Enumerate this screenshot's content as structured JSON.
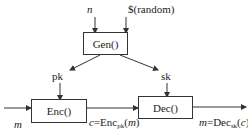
{
  "diagram": {
    "type": "public-key encryption scheme",
    "inputs": {
      "n": "n",
      "random": "$(random)"
    },
    "boxes": {
      "gen": "Gen()",
      "enc": "Enc()",
      "dec": "Dec()"
    },
    "keys": {
      "pk": "pk",
      "sk": "sk"
    },
    "message_in": "m",
    "ciphertext": {
      "prefix": "c=Enc",
      "sub": "pk",
      "suffix": "(m)"
    },
    "message_out": {
      "prefix": "m=Dec",
      "sub": "sk",
      "suffix": "(c)"
    }
  }
}
